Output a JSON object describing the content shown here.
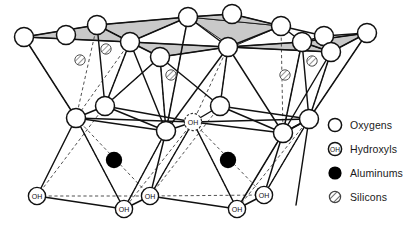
{
  "colors": {
    "line": "#111111",
    "shade": "#c9c9c9",
    "atom_fill": "#ffffff",
    "aluminum_fill": "#000000",
    "silicon_hatch": "#8a8a8a",
    "text": "#1a1a1a"
  },
  "legend": {
    "items": [
      {
        "id": "oxygens",
        "label": "Oxygens",
        "icon": "open-circle-icon"
      },
      {
        "id": "hydroxyls",
        "label": "Hydroxyls",
        "icon": "oh-circle-icon",
        "inner_text": "OH"
      },
      {
        "id": "aluminums",
        "label": "Aluminums",
        "icon": "filled-circle-icon"
      },
      {
        "id": "silicons",
        "label": "Silicons",
        "icon": "hatched-circle-icon"
      }
    ]
  },
  "structure": {
    "top_oxygens": [
      {
        "x": 66,
        "y": 35
      },
      {
        "x": 188,
        "y": 17
      },
      {
        "x": 281,
        "y": 26
      },
      {
        "x": 324,
        "y": 36
      },
      {
        "x": 97,
        "y": 25
      },
      {
        "x": 232,
        "y": 14
      }
    ],
    "upper_mid_oxygens": [
      {
        "x": 24,
        "y": 37
      },
      {
        "x": 130,
        "y": 42
      },
      {
        "x": 228,
        "y": 47
      },
      {
        "x": 302,
        "y": 42
      },
      {
        "x": 367,
        "y": 33
      },
      {
        "x": 160,
        "y": 57
      },
      {
        "x": 331,
        "y": 52
      }
    ],
    "mid_oxygens": [
      {
        "x": 76,
        "y": 118
      },
      {
        "x": 105,
        "y": 106
      },
      {
        "x": 166,
        "y": 131
      },
      {
        "x": 220,
        "y": 106
      },
      {
        "x": 283,
        "y": 133
      },
      {
        "x": 309,
        "y": 119
      }
    ],
    "mid_hydroxyls": [
      {
        "x": 193,
        "y": 122
      }
    ],
    "bottom_hydroxyls": [
      {
        "x": 37,
        "y": 196
      },
      {
        "x": 124,
        "y": 209
      },
      {
        "x": 150,
        "y": 196
      },
      {
        "x": 237,
        "y": 209
      },
      {
        "x": 264,
        "y": 195
      }
    ],
    "aluminums": [
      {
        "x": 114,
        "y": 160
      },
      {
        "x": 228,
        "y": 160
      }
    ],
    "silicons": [
      {
        "x": 80,
        "y": 60
      },
      {
        "x": 106,
        "y": 49
      },
      {
        "x": 171,
        "y": 75
      },
      {
        "x": 285,
        "y": 75
      },
      {
        "x": 312,
        "y": 61
      },
      {
        "x": 313,
        "y": 59
      }
    ]
  }
}
